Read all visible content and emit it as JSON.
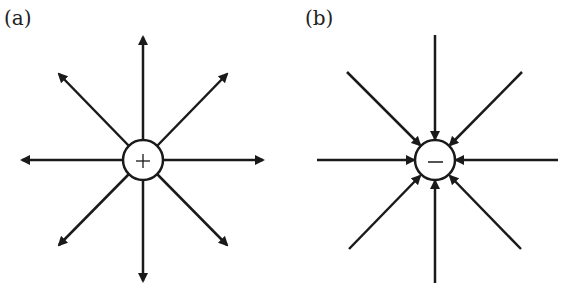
{
  "panels": [
    {
      "label": "(a)",
      "charge": "+",
      "charge_type": "positive",
      "field_direction": "outward",
      "center": [
        143,
        160
      ],
      "radius": 20
    },
    {
      "label": "(b)",
      "charge": "−",
      "charge_type": "negative",
      "field_direction": "inward",
      "center": [
        435,
        160
      ],
      "radius": 20
    }
  ],
  "colors": {
    "line": "#1a1a1a",
    "background": "#ffffff"
  }
}
